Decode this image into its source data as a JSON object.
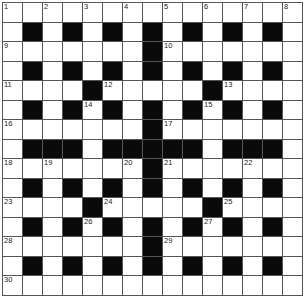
{
  "puzzle": {
    "rows": 15,
    "cols": 15,
    "pattern": [
      "...............",
      ".#.#.#.#.#.#.#.",
      ".......#.......",
      ".#.#.#.#.#.#.#.",
      "....#.....#....",
      ".#.#.#.#.#.#.#.",
      ".......#.......",
      ".###.#####.###.",
      ".......#.......",
      ".#.#.#.#.#.#.#.",
      "....#.....#....",
      ".#.#.#.#.#.#.#.",
      ".......#.......",
      ".#.#.#.#.#.#.#.",
      "..............."
    ],
    "numbers": [
      {
        "r": 0,
        "c": 0,
        "n": "1"
      },
      {
        "r": 0,
        "c": 2,
        "n": "2"
      },
      {
        "r": 0,
        "c": 4,
        "n": "3"
      },
      {
        "r": 0,
        "c": 6,
        "n": "4"
      },
      {
        "r": 0,
        "c": 8,
        "n": "5"
      },
      {
        "r": 0,
        "c": 10,
        "n": "6"
      },
      {
        "r": 0,
        "c": 12,
        "n": "7"
      },
      {
        "r": 0,
        "c": 14,
        "n": "8"
      },
      {
        "r": 2,
        "c": 0,
        "n": "9"
      },
      {
        "r": 2,
        "c": 8,
        "n": "10"
      },
      {
        "r": 4,
        "c": 0,
        "n": "11"
      },
      {
        "r": 4,
        "c": 5,
        "n": "12"
      },
      {
        "r": 4,
        "c": 11,
        "n": "13"
      },
      {
        "r": 5,
        "c": 4,
        "n": "14"
      },
      {
        "r": 5,
        "c": 10,
        "n": "15"
      },
      {
        "r": 6,
        "c": 0,
        "n": "16"
      },
      {
        "r": 6,
        "c": 8,
        "n": "17"
      },
      {
        "r": 8,
        "c": 0,
        "n": "18"
      },
      {
        "r": 8,
        "c": 2,
        "n": "19"
      },
      {
        "r": 8,
        "c": 6,
        "n": "20"
      },
      {
        "r": 8,
        "c": 8,
        "n": "21"
      },
      {
        "r": 8,
        "c": 12,
        "n": "22"
      },
      {
        "r": 10,
        "c": 0,
        "n": "23"
      },
      {
        "r": 10,
        "c": 5,
        "n": "24"
      },
      {
        "r": 10,
        "c": 11,
        "n": "25"
      },
      {
        "r": 11,
        "c": 4,
        "n": "26"
      },
      {
        "r": 11,
        "c": 10,
        "n": "27"
      },
      {
        "r": 12,
        "c": 0,
        "n": "28"
      },
      {
        "r": 12,
        "c": 8,
        "n": "29"
      },
      {
        "r": 14,
        "c": 0,
        "n": "30"
      }
    ],
    "colors": {
      "block": "#0a0a0a",
      "cell": "#ffffff",
      "line": "#555555"
    }
  }
}
